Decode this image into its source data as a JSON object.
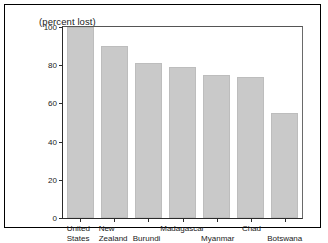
{
  "chart_data": {
    "type": "bar",
    "title": "(percent lost)",
    "xlabel": "",
    "ylabel": "",
    "ylim": [
      0,
      100
    ],
    "yticks": [
      0,
      20,
      40,
      60,
      80,
      100
    ],
    "grid": false,
    "legend": null,
    "categories": [
      "United States",
      "New Zealand",
      "Burundi",
      "Madagascar",
      "Myanmar",
      "Chad",
      "Botswana"
    ],
    "category_lines": [
      [
        "United",
        "States"
      ],
      [
        "New",
        "Zealand"
      ],
      [
        "Burundi"
      ],
      [
        "Madagascar"
      ],
      [
        "Myanmar"
      ],
      [
        "Chad"
      ],
      [
        "Botswana"
      ]
    ],
    "values": [
      100,
      90,
      81,
      79,
      75,
      74,
      55
    ],
    "bar_color": "#c9c9c9",
    "bar_edge_color": "#bdbdbd",
    "axis_color": "#2b2b2b",
    "frame_color": "#000000",
    "text_color": "#1a1a1a"
  }
}
